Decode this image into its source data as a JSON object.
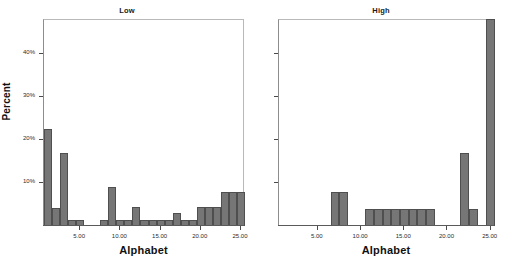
{
  "figure": {
    "yaxis_title": "Percent",
    "xaxis_title": "Alphabet",
    "bar_color": "#767676",
    "bar_border_color": "#4f4f4f",
    "axis_color": "#4a4a4a"
  },
  "panels": [
    {
      "id": "low",
      "title": "Low",
      "y_ticks": [
        "10%",
        "20%",
        "30%",
        "40%"
      ],
      "x_ticks": [
        "5.00",
        "10.00",
        "15.00",
        "20.00",
        "25.00"
      ]
    },
    {
      "id": "high",
      "title": "High",
      "y_ticks": [
        "",
        "",
        "",
        ""
      ],
      "x_ticks": [
        "5.00",
        "10.00",
        "15.00",
        "20.00",
        "25.00"
      ]
    }
  ],
  "chart_data": [
    {
      "type": "bar",
      "title": "Low",
      "xlabel": "Alphabet",
      "ylabel": "Percent",
      "xlim": [
        0.5,
        25.5
      ],
      "ylim": [
        0,
        48
      ],
      "ytick_values": [
        10,
        20,
        30,
        40
      ],
      "ytick_labels": [
        "10%",
        "20%",
        "30%",
        "40%"
      ],
      "xtick_values": [
        5,
        10,
        15,
        20,
        25
      ],
      "xtick_labels": [
        "5.00",
        "10.00",
        "15.00",
        "20.00",
        "25.00"
      ],
      "grid": false,
      "legend": "none",
      "categories": [
        1,
        2,
        3,
        4,
        5,
        6,
        7,
        8,
        9,
        10,
        11,
        12,
        13,
        14,
        15,
        16,
        17,
        18,
        19,
        20,
        21,
        22,
        23,
        24,
        25
      ],
      "values": [
        22.5,
        4.2,
        17.0,
        1.5,
        1.5,
        0,
        0,
        1.5,
        9.0,
        1.5,
        1.5,
        4.3,
        1.5,
        1.5,
        1.5,
        1.5,
        3.0,
        1.5,
        1.5,
        4.5,
        4.5,
        4.5,
        8.0,
        8.0,
        8.0
      ]
    },
    {
      "type": "bar",
      "title": "High",
      "xlabel": "Alphabet",
      "ylabel": "Percent",
      "xlim": [
        0.5,
        25.5
      ],
      "ylim": [
        0,
        48
      ],
      "ytick_values": [
        10,
        20,
        30,
        40
      ],
      "ytick_labels": [
        "",
        "",
        "",
        ""
      ],
      "xtick_values": [
        5,
        10,
        15,
        20,
        25
      ],
      "xtick_labels": [
        "5.00",
        "10.00",
        "15.00",
        "20.00",
        "25.00"
      ],
      "grid": false,
      "legend": "none",
      "categories": [
        1,
        2,
        3,
        4,
        5,
        6,
        7,
        8,
        9,
        10,
        11,
        12,
        13,
        14,
        15,
        16,
        17,
        18,
        19,
        20,
        21,
        22,
        23,
        24,
        25
      ],
      "values": [
        0,
        0,
        0,
        0,
        0,
        0,
        8.0,
        8.0,
        0,
        0,
        4.0,
        4.0,
        4.0,
        4.0,
        4.0,
        4.0,
        4.0,
        4.0,
        0,
        0,
        0,
        17.0,
        4.0,
        0,
        48.0
      ]
    }
  ]
}
